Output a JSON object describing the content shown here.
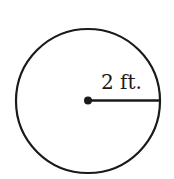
{
  "diagram": {
    "shape": "circle",
    "center": {
      "x": 88,
      "y": 101
    },
    "radius_px": 72,
    "radius_label": "2 ft.",
    "stroke_color": "#1a1a1a",
    "background_color": "#ffffff"
  }
}
